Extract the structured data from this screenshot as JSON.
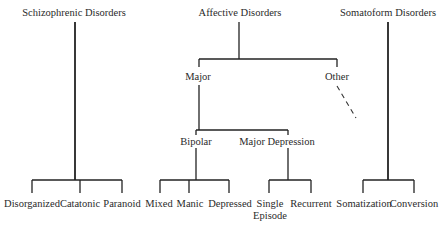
{
  "diagram": {
    "type": "taxonomy-tree",
    "roots": [
      {
        "label": "Schizophrenic Disorders",
        "children": [
          "Disorganized",
          "Catatonic",
          "Paranoid"
        ]
      },
      {
        "label": "Affective Disorders",
        "children": [
          {
            "label": "Major",
            "children": [
              {
                "label": "Bipolar",
                "children": [
                  "Mixed",
                  "Manic",
                  "Depressed"
                ]
              },
              {
                "label": "Major Depression",
                "children": [
                  "Single Episode",
                  "Recurrent"
                ]
              }
            ]
          },
          {
            "label": "Other",
            "note": "dashed connector (unspecified)"
          }
        ]
      },
      {
        "label": "Somatoform Disorders",
        "children": [
          "Somatization",
          "Conversion"
        ]
      }
    ]
  },
  "labels": {
    "schizophrenic": "Schizophrenic Disorders",
    "affective": "Affective Disorders",
    "somatoform": "Somatoform Disorders",
    "major": "Major",
    "other": "Other",
    "bipolar": "Bipolar",
    "major_depression": "Major Depression",
    "disorganized": "Disorganized",
    "catatonic": "Catatonic",
    "paranoid": "Paranoid",
    "mixed": "Mixed",
    "manic": "Manic",
    "depressed": "Depressed",
    "single_episode_1": "Single",
    "single_episode_2": "Episode",
    "recurrent": "Recurrent",
    "somatization": "Somatization",
    "conversion": "Conversion"
  }
}
